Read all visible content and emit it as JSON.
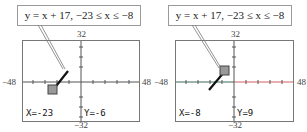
{
  "panels": [
    {
      "equation": "y = x + 17,  −23 ≤ x ≤ −8",
      "window": {
        "ymax": "32",
        "ymin": "−32",
        "xmin": "−48",
        "xmax": "48"
      },
      "trace": {
        "x_readout": "X=-23",
        "y_readout": "Y=-6",
        "cursor_at": "start"
      }
    },
    {
      "equation": "y = x + 17,  −23 ≤ x ≤ −8",
      "window": {
        "ymax": "32",
        "ymin": "−32",
        "xmin": "−48",
        "xmax": "48"
      },
      "trace": {
        "x_readout": "X=-8",
        "y_readout": "Y=9",
        "cursor_at": "end"
      }
    }
  ],
  "colors": {
    "axis_left": "#3a6a5a",
    "axis_right": "#d06060",
    "line": "#111111",
    "cursor": "#888888"
  }
}
